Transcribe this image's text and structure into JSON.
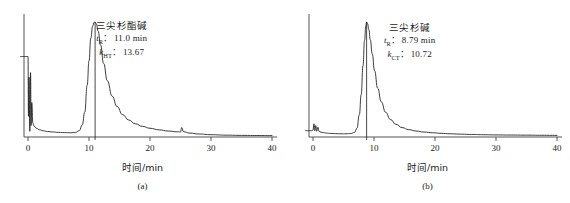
{
  "figure": {
    "background": "#ffffff",
    "trace_color": "#1a1a1a",
    "axis_color": "#555555"
  },
  "chart_data": [
    {
      "type": "line",
      "panel": "(a)",
      "title": "",
      "xlabel": "时间/min",
      "ylabel": "",
      "xlim": [
        -2,
        41
      ],
      "ylim": [
        0,
        1.08
      ],
      "xticks": [
        0,
        10,
        20,
        30,
        40
      ],
      "xtick_labels": [
        "0",
        "10",
        "20",
        "30",
        "40"
      ],
      "yticks": [],
      "grid": false,
      "legend": "none",
      "annotations": {
        "compound_name": "三尖杉酯碱",
        "retention_symbol": "t",
        "retention_subscript": "R",
        "retention_separator": "：",
        "retention_value": "11.0 min",
        "capacity_symbol": "k",
        "capacity_subscript": "HT",
        "capacity_separator": "：",
        "capacity_value": "13.67"
      },
      "peak": {
        "retention_time_min": 11.0,
        "capacity_factor": 13.67,
        "apex_height": 1.0,
        "dropline_x": 11.0
      },
      "features": [
        {
          "name": "injection-spike",
          "x": 0.0,
          "height": 0.72
        },
        {
          "name": "secondary-spike",
          "x": 0.45,
          "height": 0.58
        },
        {
          "name": "artifact-spike",
          "x": 25.2,
          "height": 0.065
        },
        {
          "name": "baseline-level",
          "x": 40.0,
          "height": 0.012
        }
      ],
      "series": [
        {
          "name": "chromatogram-a",
          "x": [
            -1.2,
            -0.6,
            -0.2,
            0.0,
            0.08,
            0.16,
            0.3,
            0.42,
            0.5,
            0.62,
            0.8,
            1.0,
            1.4,
            1.9,
            2.5,
            3.2,
            4.0,
            5.0,
            6.0,
            7.0,
            7.8,
            8.4,
            8.9,
            9.3,
            9.7,
            10.0,
            10.3,
            10.6,
            10.85,
            11.0,
            11.2,
            11.5,
            11.9,
            12.4,
            13.0,
            13.8,
            14.6,
            15.5,
            16.5,
            17.6,
            18.8,
            20.0,
            21.5,
            23.0,
            24.5,
            25.0,
            25.2,
            25.5,
            26.5,
            28.0,
            30.0,
            32.5,
            35.0,
            37.5,
            40.0
          ],
          "y": [
            0.7,
            0.7,
            0.7,
            0.7,
            0.18,
            0.52,
            0.05,
            0.56,
            0.1,
            0.3,
            0.12,
            0.095,
            0.075,
            0.062,
            0.054,
            0.048,
            0.044,
            0.04,
            0.038,
            0.037,
            0.04,
            0.055,
            0.105,
            0.215,
            0.45,
            0.66,
            0.86,
            0.965,
            0.998,
            1.0,
            0.985,
            0.92,
            0.8,
            0.64,
            0.49,
            0.355,
            0.265,
            0.195,
            0.148,
            0.115,
            0.092,
            0.076,
            0.062,
            0.052,
            0.045,
            0.044,
            0.082,
            0.046,
            0.034,
            0.026,
            0.02,
            0.016,
            0.014,
            0.013,
            0.012
          ]
        }
      ]
    },
    {
      "type": "line",
      "panel": "(b)",
      "title": "",
      "xlabel": "时间/min",
      "ylabel": "",
      "xlim": [
        -2,
        41
      ],
      "ylim": [
        0,
        1.08
      ],
      "xticks": [
        0,
        10,
        20,
        30,
        40
      ],
      "xtick_labels": [
        "0",
        "10",
        "20",
        "30",
        "40"
      ],
      "yticks": [],
      "grid": false,
      "legend": "none",
      "annotations": {
        "compound_name": "三尖杉碱",
        "retention_symbol": "t",
        "retention_subscript": "R",
        "retention_separator": "：",
        "retention_value": "8.79 min",
        "capacity_symbol": "k",
        "capacity_subscript": "CT",
        "capacity_separator": "：",
        "capacity_value": "10.72"
      },
      "peak": {
        "retention_time_min": 8.79,
        "capacity_factor": 10.72,
        "apex_height": 1.0,
        "dropline_x": 8.79
      },
      "features": [
        {
          "name": "injection-spike-cluster",
          "x": 0.2,
          "height": 0.12
        },
        {
          "name": "baseline-level",
          "x": 40.0,
          "height": 0.014
        }
      ],
      "series": [
        {
          "name": "chromatogram-b",
          "x": [
            -1.2,
            -0.6,
            -0.2,
            0.0,
            0.15,
            0.3,
            0.45,
            0.6,
            0.8,
            1.0,
            1.3,
            1.7,
            2.2,
            2.9,
            3.7,
            4.6,
            5.4,
            6.2,
            6.8,
            7.2,
            7.6,
            7.9,
            8.2,
            8.45,
            8.65,
            8.79,
            8.95,
            9.15,
            9.4,
            9.7,
            10.1,
            10.6,
            11.2,
            11.9,
            12.7,
            13.6,
            14.6,
            15.7,
            16.9,
            18.2,
            19.6,
            21.0,
            22.5,
            24.0,
            26.0,
            28.0,
            30.0,
            32.5,
            35.0,
            37.5,
            40.0
          ],
          "y": [
            0.055,
            0.055,
            0.055,
            0.06,
            0.115,
            0.055,
            0.1,
            0.05,
            0.085,
            0.048,
            0.042,
            0.038,
            0.034,
            0.031,
            0.029,
            0.028,
            0.028,
            0.03,
            0.04,
            0.075,
            0.195,
            0.37,
            0.62,
            0.84,
            0.965,
            1.0,
            0.985,
            0.935,
            0.845,
            0.725,
            0.575,
            0.425,
            0.305,
            0.215,
            0.152,
            0.11,
            0.082,
            0.064,
            0.052,
            0.043,
            0.037,
            0.032,
            0.028,
            0.025,
            0.022,
            0.02,
            0.018,
            0.017,
            0.016,
            0.015,
            0.014
          ]
        }
      ]
    }
  ]
}
